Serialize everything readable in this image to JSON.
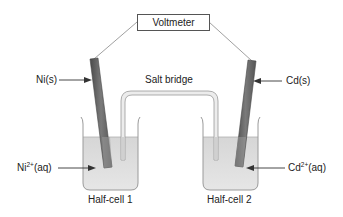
{
  "diagram": {
    "voltmeter": {
      "label": "Voltmeter"
    },
    "salt_bridge": {
      "label": "Salt bridge"
    },
    "half_cells": [
      {
        "label": "Half-cell 1",
        "electrode": {
          "label_base": "Ni(s)"
        },
        "solution": {
          "label_base": "Ni",
          "label_sup": "2+",
          "label_suffix": "(aq)"
        }
      },
      {
        "label": "Half-cell 2",
        "electrode": {
          "label_base": "Cd(s)"
        },
        "solution": {
          "label_base": "Cd",
          "label_sup": "2+",
          "label_suffix": "(aq)"
        }
      }
    ],
    "colors": {
      "electrode_dark": "#555555",
      "electrode_light": "#8a8a8a",
      "solution": "#dcdcdc",
      "beaker_outline": "#9a9a9a",
      "wire": "#777777",
      "text": "#222222"
    }
  }
}
